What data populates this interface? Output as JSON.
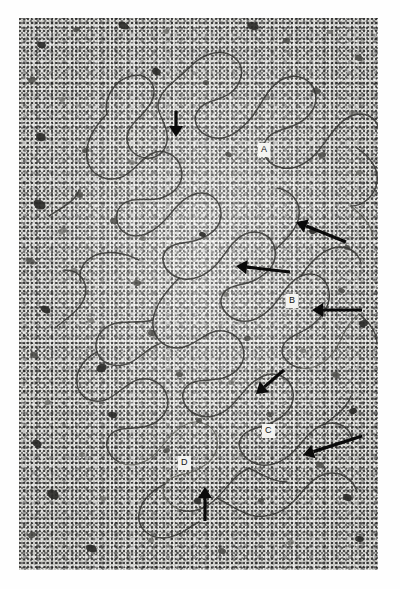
{
  "figure": {
    "kind": "electron-micrograph",
    "width": 400,
    "height": 589,
    "border_color": "#ffffff",
    "plate_background": "#d6d6d2",
    "filament_color": "#3a3a38",
    "arrow_color": "#0b0b0b",
    "label_box_color": "#f4f4f1"
  },
  "labels": [
    {
      "text": "A",
      "x": 258,
      "y": 143
    },
    {
      "text": "B",
      "x": 286,
      "y": 294
    },
    {
      "text": "C",
      "x": 262,
      "y": 424
    },
    {
      "text": "D",
      "x": 178,
      "y": 456
    }
  ],
  "arrows": [
    {
      "name": "arrow-top-down",
      "x1": 176,
      "y1": 111,
      "x2": 176,
      "y2": 137,
      "direction": "down"
    },
    {
      "name": "arrow-upper-right-left",
      "x1": 346,
      "y1": 242,
      "x2": 296,
      "y2": 222,
      "direction": "up-left"
    },
    {
      "name": "arrow-mid-left",
      "x1": 290,
      "y1": 272,
      "x2": 236,
      "y2": 266,
      "direction": "left"
    },
    {
      "name": "arrow-b-right-left",
      "x1": 362,
      "y1": 310,
      "x2": 312,
      "y2": 310,
      "direction": "left"
    },
    {
      "name": "arrow-lower-mid-down",
      "x1": 284,
      "y1": 370,
      "x2": 256,
      "y2": 394,
      "direction": "down-left"
    },
    {
      "name": "arrow-c-right-left",
      "x1": 362,
      "y1": 436,
      "x2": 303,
      "y2": 455,
      "direction": "down-left"
    },
    {
      "name": "arrow-bottom-up",
      "x1": 205,
      "y1": 521,
      "x2": 205,
      "y2": 487,
      "direction": "up"
    }
  ],
  "blobs": [
    {
      "x": 37,
      "y": 42,
      "w": 9,
      "h": 6,
      "r": 14,
      "tone": "d"
    },
    {
      "x": 73,
      "y": 27,
      "w": 7,
      "h": 5,
      "r": -20,
      "tone": ""
    },
    {
      "x": 118,
      "y": 22,
      "w": 11,
      "h": 7,
      "r": 30,
      "tone": "d"
    },
    {
      "x": 163,
      "y": 29,
      "w": 6,
      "h": 5,
      "r": 0,
      "tone": "l"
    },
    {
      "x": 247,
      "y": 22,
      "w": 12,
      "h": 8,
      "r": 20,
      "tone": "d"
    },
    {
      "x": 283,
      "y": 38,
      "w": 7,
      "h": 5,
      "r": -15,
      "tone": ""
    },
    {
      "x": 327,
      "y": 30,
      "w": 6,
      "h": 4,
      "r": 10,
      "tone": "l"
    },
    {
      "x": 355,
      "y": 55,
      "w": 8,
      "h": 6,
      "r": 25,
      "tone": ""
    },
    {
      "x": 28,
      "y": 77,
      "w": 8,
      "h": 6,
      "r": -30,
      "tone": ""
    },
    {
      "x": 59,
      "y": 97,
      "w": 6,
      "h": 5,
      "r": 0,
      "tone": "l"
    },
    {
      "x": 152,
      "y": 68,
      "w": 9,
      "h": 7,
      "r": 35,
      "tone": "d"
    },
    {
      "x": 203,
      "y": 80,
      "w": 6,
      "h": 5,
      "r": 0,
      "tone": ""
    },
    {
      "x": 263,
      "y": 95,
      "w": 7,
      "h": 5,
      "r": -25,
      "tone": "l"
    },
    {
      "x": 312,
      "y": 88,
      "w": 9,
      "h": 6,
      "r": 15,
      "tone": ""
    },
    {
      "x": 349,
      "y": 110,
      "w": 7,
      "h": 6,
      "r": 0,
      "tone": "l"
    },
    {
      "x": 36,
      "y": 133,
      "w": 10,
      "h": 8,
      "r": 25,
      "tone": "d"
    },
    {
      "x": 82,
      "y": 148,
      "w": 7,
      "h": 5,
      "r": -15,
      "tone": ""
    },
    {
      "x": 129,
      "y": 160,
      "w": 6,
      "h": 5,
      "r": 0,
      "tone": "l"
    },
    {
      "x": 225,
      "y": 152,
      "w": 7,
      "h": 5,
      "r": 20,
      "tone": ""
    },
    {
      "x": 318,
      "y": 152,
      "w": 8,
      "h": 6,
      "r": -20,
      "tone": ""
    },
    {
      "x": 356,
      "y": 170,
      "w": 6,
      "h": 5,
      "r": 0,
      "tone": "l"
    },
    {
      "x": 33,
      "y": 200,
      "w": 13,
      "h": 9,
      "r": 30,
      "tone": "d"
    },
    {
      "x": 76,
      "y": 192,
      "w": 7,
      "h": 6,
      "r": 0,
      "tone": ""
    },
    {
      "x": 58,
      "y": 228,
      "w": 9,
      "h": 6,
      "r": -25,
      "tone": "l"
    },
    {
      "x": 110,
      "y": 218,
      "w": 8,
      "h": 6,
      "r": 15,
      "tone": ""
    },
    {
      "x": 140,
      "y": 236,
      "w": 6,
      "h": 5,
      "r": 0,
      "tone": "l"
    },
    {
      "x": 199,
      "y": 232,
      "w": 7,
      "h": 5,
      "r": 20,
      "tone": "d"
    },
    {
      "x": 309,
      "y": 228,
      "w": 8,
      "h": 6,
      "r": -15,
      "tone": "d"
    },
    {
      "x": 344,
      "y": 245,
      "w": 6,
      "h": 5,
      "r": 0,
      "tone": ""
    },
    {
      "x": 26,
      "y": 258,
      "w": 9,
      "h": 6,
      "r": 25,
      "tone": ""
    },
    {
      "x": 70,
      "y": 268,
      "w": 7,
      "h": 5,
      "r": -20,
      "tone": "l"
    },
    {
      "x": 133,
      "y": 280,
      "w": 8,
      "h": 6,
      "r": 10,
      "tone": ""
    },
    {
      "x": 223,
      "y": 292,
      "w": 6,
      "h": 5,
      "r": 0,
      "tone": "l"
    },
    {
      "x": 338,
      "y": 288,
      "w": 7,
      "h": 5,
      "r": 20,
      "tone": ""
    },
    {
      "x": 359,
      "y": 320,
      "w": 9,
      "h": 7,
      "r": -20,
      "tone": "d"
    },
    {
      "x": 40,
      "y": 306,
      "w": 11,
      "h": 7,
      "r": 30,
      "tone": "d"
    },
    {
      "x": 88,
      "y": 318,
      "w": 6,
      "h": 5,
      "r": 0,
      "tone": "l"
    },
    {
      "x": 148,
      "y": 330,
      "w": 8,
      "h": 6,
      "r": 15,
      "tone": ""
    },
    {
      "x": 244,
      "y": 336,
      "w": 7,
      "h": 5,
      "r": -15,
      "tone": ""
    },
    {
      "x": 300,
      "y": 348,
      "w": 6,
      "h": 5,
      "r": 0,
      "tone": "l"
    },
    {
      "x": 30,
      "y": 352,
      "w": 8,
      "h": 6,
      "r": 25,
      "tone": ""
    },
    {
      "x": 96,
      "y": 364,
      "w": 11,
      "h": 8,
      "r": -25,
      "tone": "d"
    },
    {
      "x": 176,
      "y": 372,
      "w": 7,
      "h": 5,
      "r": 10,
      "tone": ""
    },
    {
      "x": 228,
      "y": 380,
      "w": 6,
      "h": 5,
      "r": 0,
      "tone": "l"
    },
    {
      "x": 332,
      "y": 372,
      "w": 8,
      "h": 6,
      "r": 20,
      "tone": ""
    },
    {
      "x": 44,
      "y": 400,
      "w": 7,
      "h": 5,
      "r": -20,
      "tone": "l"
    },
    {
      "x": 108,
      "y": 412,
      "w": 9,
      "h": 6,
      "r": 15,
      "tone": "d"
    },
    {
      "x": 196,
      "y": 418,
      "w": 6,
      "h": 5,
      "r": 0,
      "tone": ""
    },
    {
      "x": 266,
      "y": 412,
      "w": 7,
      "h": 5,
      "r": 25,
      "tone": ""
    },
    {
      "x": 349,
      "y": 408,
      "w": 8,
      "h": 6,
      "r": -15,
      "tone": "d"
    },
    {
      "x": 32,
      "y": 440,
      "w": 10,
      "h": 7,
      "r": 30,
      "tone": "d"
    },
    {
      "x": 79,
      "y": 452,
      "w": 6,
      "h": 5,
      "r": 0,
      "tone": "l"
    },
    {
      "x": 163,
      "y": 448,
      "w": 7,
      "h": 5,
      "r": -20,
      "tone": ""
    },
    {
      "x": 239,
      "y": 452,
      "w": 6,
      "h": 5,
      "r": 0,
      "tone": "l"
    },
    {
      "x": 316,
      "y": 462,
      "w": 8,
      "h": 6,
      "r": 20,
      "tone": ""
    },
    {
      "x": 47,
      "y": 490,
      "w": 12,
      "h": 9,
      "r": 25,
      "tone": "d"
    },
    {
      "x": 100,
      "y": 496,
      "w": 6,
      "h": 5,
      "r": 0,
      "tone": "l"
    },
    {
      "x": 194,
      "y": 498,
      "w": 7,
      "h": 6,
      "r": -15,
      "tone": "d"
    },
    {
      "x": 258,
      "y": 498,
      "w": 6,
      "h": 5,
      "r": 0,
      "tone": ""
    },
    {
      "x": 343,
      "y": 494,
      "w": 9,
      "h": 7,
      "r": 20,
      "tone": "d"
    },
    {
      "x": 28,
      "y": 532,
      "w": 8,
      "h": 6,
      "r": -25,
      "tone": ""
    },
    {
      "x": 86,
      "y": 545,
      "w": 11,
      "h": 7,
      "r": 15,
      "tone": "d"
    },
    {
      "x": 148,
      "y": 538,
      "w": 6,
      "h": 5,
      "r": 0,
      "tone": "l"
    },
    {
      "x": 218,
      "y": 548,
      "w": 8,
      "h": 6,
      "r": 20,
      "tone": ""
    },
    {
      "x": 287,
      "y": 540,
      "w": 7,
      "h": 5,
      "r": -20,
      "tone": "l"
    },
    {
      "x": 355,
      "y": 536,
      "w": 9,
      "h": 6,
      "r": 10,
      "tone": "d"
    }
  ],
  "filaments": [
    "M 88 96 C 84 80 96 62 112 58 C 128 54 138 66 134 80 C 130 94 116 100 110 112 C 104 124 112 138 126 140 C 140 142 150 130 148 116 C 146 102 136 94 140 82 C 144 70 158 62 172 48 C 186 34 204 30 216 40 C 228 50 222 68 210 76 C 198 84 184 82 178 94 C 172 106 182 118 196 120 C 210 122 222 112 232 100 C 242 88 248 70 262 62 C 276 54 292 60 296 74 C 300 88 290 100 278 106 C 266 112 252 112 246 124 C 240 136 250 148 264 150",
    "M 264 150 C 278 152 290 144 300 132 C 310 120 318 104 332 98 C 346 92 358 100 360 112",
    "M 88 96 C 76 108 66 124 68 140 C 70 156 86 164 100 160 C 114 156 120 142 132 136 C 144 130 158 136 162 150 C 166 164 156 176 142 180 C 128 184 114 178 104 186 C 94 194 96 210 108 216 C 120 222 134 214 144 204 C 154 194 162 180 176 176 C 190 172 202 182 202 196 C 202 210 190 218 178 222 C 166 226 152 224 146 234 C 140 244 148 256 160 260",
    "M 160 260 C 172 264 186 258 196 248 C 206 238 212 222 226 216 C 240 210 254 218 256 232 C 258 246 248 256 236 262 C 224 268 210 266 204 276 C 198 286 206 298 218 302",
    "M 218 302 C 230 306 242 300 252 290 C 262 280 268 264 282 258 C 296 252 308 260 310 274 C 312 288 302 300 292 308 C 282 316 268 318 264 328 C 260 338 270 348 282 350",
    "M 282 350 C 296 352 308 344 316 332 C 324 320 328 304 340 296",
    "M 282 258 C 290 246 300 234 314 230 C 328 226 340 234 342 246",
    "M 160 260 C 148 272 136 286 134 302 C 132 318 144 330 158 330 C 172 330 182 318 194 314 C 206 310 220 316 224 330 C 228 344 218 356 204 360 C 190 364 176 360 168 368 C 160 376 164 390 176 396",
    "M 176 396 C 188 402 202 398 212 388 C 222 378 230 364 244 358 C 258 352 272 360 274 374 C 276 388 266 398 254 404 C 242 410 228 410 222 420 C 216 430 226 442 238 446",
    "M 238 446 C 250 450 264 444 274 434 C 284 424 292 410 306 406 C 320 402 332 410 334 424",
    "M 134 302 C 120 306 106 302 94 306 C 82 310 74 322 78 334 C 82 346 96 350 108 346 C 120 342 128 330 140 326",
    "M 78 334 C 66 340 56 352 58 366 C 60 380 74 386 86 382 C 98 378 106 366 118 362 C 130 358 144 364 148 378 C 152 392 142 404 128 408 C 114 412 100 408 92 416 C 84 424 88 438 100 444",
    "M 100 444 C 112 450 126 446 136 436 C 146 426 154 412 168 406 C 182 400 196 408 198 422 C 200 436 190 446 178 452 C 166 458 152 456 146 466 C 140 476 150 488 162 492",
    "M 162 492 C 174 496 188 490 198 480 C 208 470 216 456 230 450",
    "M 198 480 C 210 486 222 496 236 498 C 250 500 264 494 274 484 C 284 474 292 460 306 456 C 320 452 334 460 338 474",
    "M 146 466 C 134 472 122 482 120 496 C 118 510 130 520 144 520 C 158 520 168 510 180 504",
    "M 36 310 C 48 300 62 292 66 278 C 70 264 60 252 46 252",
    "M 30 198 C 42 190 56 184 60 172",
    "M 338 130 C 350 138 360 150 358 164 C 356 178 344 188 332 188",
    "M 332 188 C 342 196 352 206 354 218",
    "M 120 242 C 108 236 94 232 80 236 C 66 240 58 252 62 264",
    "M 256 232 C 266 222 278 212 280 198 C 282 184 272 172 258 170",
    "M 340 296 C 350 304 358 314 358 326",
    "M 230 450 C 242 456 254 464 268 464",
    "M 306 406 C 316 398 328 390 332 378"
  ]
}
